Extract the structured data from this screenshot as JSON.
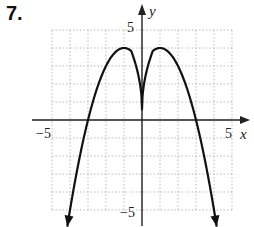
{
  "problem": {
    "number": "7."
  },
  "chart_data": {
    "type": "line",
    "title": "",
    "xlabel": "x",
    "ylabel": "y",
    "xlim": [
      -5,
      5
    ],
    "ylim": [
      -5,
      5
    ],
    "grid": true,
    "x_tick_labels": [
      "-5",
      "5"
    ],
    "y_tick_labels": [
      "5",
      "-5"
    ],
    "series": [
      {
        "name": "curve",
        "description": "Even function with two maxima at (-1,4) and (1,4), a sharp cusp at the y-axis near the origin, x-intercepts at -3 and 3, arrows continuing downward",
        "x": [
          -4.15,
          -3.5,
          -3,
          -2.5,
          -2,
          -1.5,
          -1,
          -0.5,
          -0.2,
          0,
          0.2,
          0.5,
          1,
          1.5,
          2,
          2.5,
          3,
          3.5,
          4.15
        ],
        "y": [
          -5,
          -2.25,
          0,
          1.75,
          3,
          3.75,
          4,
          3.6,
          2.6,
          0.6,
          2.6,
          3.6,
          4,
          3.75,
          3,
          1.75,
          0,
          -2.25,
          -5
        ]
      }
    ],
    "key_points": {
      "maxima": [
        [
          -1,
          4
        ],
        [
          1,
          4
        ]
      ],
      "cusp": [
        0,
        0.6
      ],
      "x_intercepts": [
        -3,
        3
      ]
    }
  },
  "labels": {
    "x_axis": "x",
    "y_axis": "y",
    "x_min": "−5",
    "x_max": "5",
    "y_max": "5",
    "y_min": "−5"
  }
}
